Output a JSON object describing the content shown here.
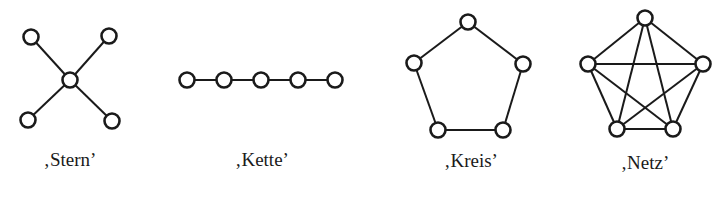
{
  "figure": {
    "colors": {
      "ink": "#1a1a1a",
      "background": "#ffffff"
    },
    "networks": [
      {
        "id": "stern",
        "label": "‚Stern’",
        "node_count": 5,
        "nodes": [
          "center",
          "top-left",
          "top-right",
          "bottom-left",
          "bottom-right"
        ],
        "edges": [
          [
            "center",
            "top-left"
          ],
          [
            "center",
            "top-right"
          ],
          [
            "center",
            "bottom-left"
          ],
          [
            "center",
            "bottom-right"
          ]
        ]
      },
      {
        "id": "kette",
        "label": "‚Kette’",
        "node_count": 5,
        "nodes": [
          "n1",
          "n2",
          "n3",
          "n4",
          "n5"
        ],
        "edges": [
          [
            "n1",
            "n2"
          ],
          [
            "n2",
            "n3"
          ],
          [
            "n3",
            "n4"
          ],
          [
            "n4",
            "n5"
          ]
        ]
      },
      {
        "id": "kreis",
        "label": "‚Kreis’",
        "node_count": 5,
        "nodes": [
          "top",
          "right",
          "bottom-right",
          "bottom-left",
          "left"
        ],
        "edges": [
          [
            "top",
            "right"
          ],
          [
            "right",
            "bottom-right"
          ],
          [
            "bottom-right",
            "bottom-left"
          ],
          [
            "bottom-left",
            "left"
          ],
          [
            "left",
            "top"
          ]
        ]
      },
      {
        "id": "netz",
        "label": "‚Netz’",
        "node_count": 5,
        "nodes": [
          "top",
          "right",
          "bottom-right",
          "bottom-left",
          "left"
        ],
        "edges": [
          [
            "top",
            "right"
          ],
          [
            "top",
            "bottom-right"
          ],
          [
            "top",
            "bottom-left"
          ],
          [
            "top",
            "left"
          ],
          [
            "right",
            "bottom-right"
          ],
          [
            "right",
            "bottom-left"
          ],
          [
            "right",
            "left"
          ],
          [
            "bottom-right",
            "bottom-left"
          ],
          [
            "bottom-right",
            "left"
          ],
          [
            "bottom-left",
            "left"
          ]
        ]
      }
    ]
  }
}
